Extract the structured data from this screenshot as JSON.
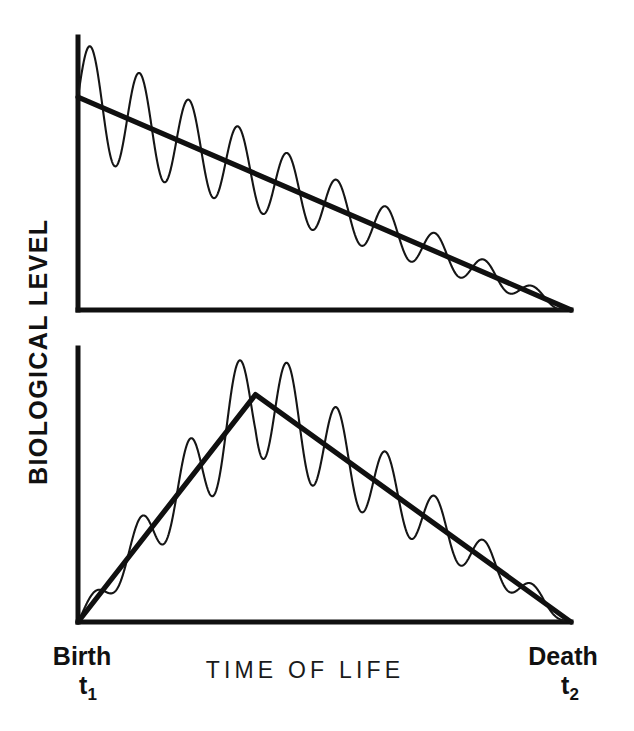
{
  "figure": {
    "ylabel": "BIOLOGICAL LEVEL",
    "xlabel": "TIME OF LIFE",
    "start_label": "Birth",
    "start_symbol": "t",
    "start_symbol_sub": "1",
    "end_label": "Death",
    "end_symbol": "t",
    "end_symbol_sub": "2",
    "line_color": "#101010",
    "background_color": "#ffffff"
  },
  "chart_data": [
    {
      "type": "line",
      "panel": "top",
      "title": "",
      "xlabel": "TIME OF LIFE",
      "ylabel": "BIOLOGICAL LEVEL",
      "xlim": [
        0,
        1
      ],
      "ylim": [
        0,
        1
      ],
      "grid": false,
      "legend": "none",
      "xticklabels": [
        "Birth t1",
        "Death t2"
      ],
      "yticklabels": [],
      "description": "Monotonic linear decline in biological level from birth to death with a superimposed oscillation whose amplitude damps progressively to zero at death.",
      "series": [
        {
          "name": "trend",
          "kind": "straight-decline",
          "x": [
            0,
            1
          ],
          "values": [
            0.78,
            0.0
          ]
        },
        {
          "name": "oscillation",
          "kind": "damped-sine",
          "cycles": 10,
          "amplitude_start": 0.21,
          "amplitude_end": 0.012,
          "amplitude_envelope": "linear-decay",
          "about": "trend"
        }
      ]
    },
    {
      "type": "line",
      "panel": "bottom",
      "title": "",
      "xlabel": "TIME OF LIFE",
      "ylabel": "BIOLOGICAL LEVEL",
      "xlim": [
        0,
        1
      ],
      "ylim": [
        0,
        1
      ],
      "grid": false,
      "legend": "none",
      "xticklabels": [
        "Birth t1",
        "Death t2"
      ],
      "yticklabels": [],
      "description": "Biological level rises linearly from zero at birth to a peak at roughly 36 percent of the lifespan, then declines linearly to zero at death. The superimposed oscillation grows toward the peak and damps to zero at death.",
      "series": [
        {
          "name": "trend",
          "kind": "triangular-rise-fall",
          "x": [
            0,
            0.36,
            1
          ],
          "values": [
            0.0,
            0.83,
            0.0
          ],
          "peak_x": 0.36,
          "peak_value": 0.83
        },
        {
          "name": "oscillation",
          "kind": "amplitude-modulated-sine",
          "cycles": 10,
          "amplitude_start": 0.02,
          "amplitude_peak": 0.22,
          "amplitude_end": 0.012,
          "amplitude_envelope": "rise-then-decay",
          "about": "trend"
        }
      ]
    }
  ]
}
